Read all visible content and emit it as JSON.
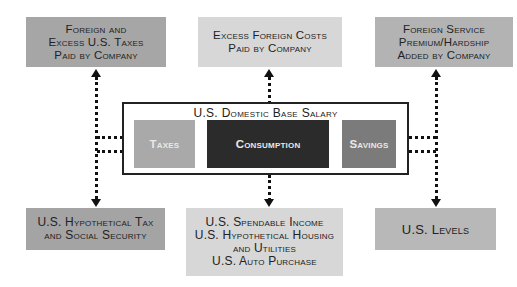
{
  "diagram": {
    "top_boxes": [
      {
        "lines": [
          "Foreign and",
          "Excess U.S. Taxes",
          "Paid by Company"
        ],
        "color": "#a6a6a6"
      },
      {
        "lines": [
          "Excess Foreign Costs",
          "Paid by Company"
        ],
        "color": "#d7d7d7"
      },
      {
        "lines": [
          "Foreign Service",
          "Premium/Hardship",
          "Added by Company"
        ],
        "color": "#b3b3b3"
      }
    ],
    "container": {
      "title": "U.S. Domestic Base Salary",
      "components": [
        {
          "label": "Taxes",
          "color": "#a9a9a9"
        },
        {
          "label": "Consumption",
          "color": "#2b2b2b"
        },
        {
          "label": "Savings",
          "color": "#7b7b7b"
        }
      ]
    },
    "bottom_boxes": [
      {
        "lines": [
          "U.S. Hypothetical Tax",
          "and Social Security"
        ],
        "color": "#a4a4a4"
      },
      {
        "lines": [
          "U.S. Spendable Income",
          "U.S. Hypothetical Housing",
          "and Utilities",
          "U.S. Auto Purchase"
        ],
        "color": "#d7d7d7"
      },
      {
        "lines": [
          "U.S. Levels"
        ],
        "color": "#b8b8b8"
      }
    ],
    "connector_style": "dotted double-headed arrows"
  }
}
